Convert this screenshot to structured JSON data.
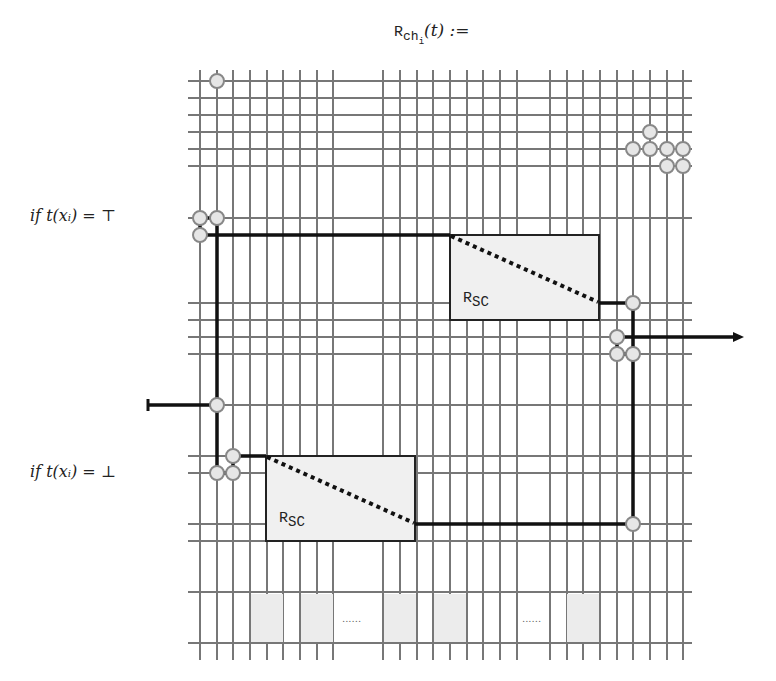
{
  "title": {
    "prefix": "R",
    "subscript": "ch",
    "subsubscript": "i",
    "suffix": "(t) :="
  },
  "conditions": {
    "top": "if  t(xᵢ) = ⊤",
    "bottom": "if  t(xᵢ) = ⊥"
  },
  "gadgets": [
    {
      "label": "R",
      "sub": "SC",
      "position": "upper-right"
    },
    {
      "label": "R",
      "sub": "SC",
      "position": "lower-left"
    }
  ],
  "ellipses": [
    "......",
    "......"
  ],
  "colors": {
    "grid": "#777777",
    "path": "#111111",
    "stone_fill": "#e6e6e6",
    "stone_stroke": "#888888",
    "gadget_fill": "#efefef"
  },
  "grid": {
    "x_lines": [
      200,
      217,
      233,
      250,
      267,
      283,
      300,
      317,
      333,
      383,
      400,
      417,
      433,
      450,
      467,
      483,
      500,
      517,
      550,
      567,
      583,
      600,
      617,
      633,
      650,
      667,
      683
    ],
    "y_lines": [
      81,
      98,
      115,
      132,
      149,
      166,
      218,
      303,
      320,
      337,
      354,
      405,
      456,
      473,
      524,
      541,
      592,
      643
    ],
    "left": 188,
    "right": 692,
    "top": 70,
    "bottom": 660
  }
}
